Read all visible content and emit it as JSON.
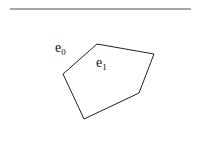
{
  "figure": {
    "rule": {
      "x1": 10,
      "y1": 9,
      "x2": 191,
      "y2": 9,
      "color": "#8a8a8a"
    },
    "polygon": {
      "points": [
        [
          97,
          44
        ],
        [
          154,
          54
        ],
        [
          139,
          93
        ],
        [
          84,
          119
        ],
        [
          63,
          74
        ]
      ],
      "stroke": "#222222"
    },
    "labels": [
      {
        "base": "e",
        "sub": "0",
        "x": 55,
        "y": 52
      },
      {
        "base": "e",
        "sub": "1",
        "x": 96,
        "y": 67
      }
    ]
  }
}
